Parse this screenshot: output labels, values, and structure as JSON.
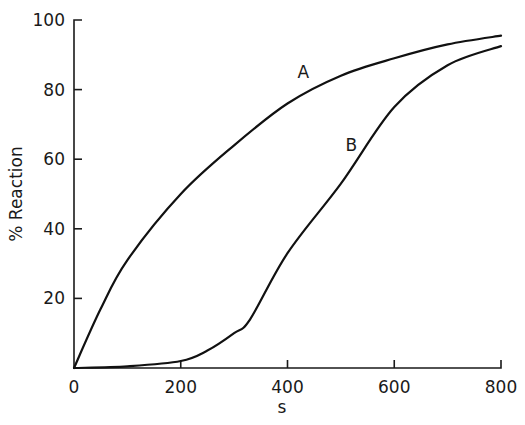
{
  "chart_data": {
    "type": "line",
    "title": "",
    "xlabel": "s",
    "ylabel": "% Reaction",
    "xlim": [
      0,
      800
    ],
    "ylim": [
      0,
      100
    ],
    "grid": false,
    "legend": "none (curves labelled inline)",
    "x_ticks": [
      0,
      200,
      400,
      600,
      800
    ],
    "y_ticks": [
      20,
      40,
      60,
      80,
      100
    ],
    "x_tick_labels": [
      "0",
      "200",
      "400",
      "600",
      "800"
    ],
    "y_tick_labels": [
      "20",
      "40",
      "60",
      "80",
      "100"
    ],
    "series": [
      {
        "name": "A",
        "x": [
          0,
          50,
          100,
          200,
          300,
          400,
          500,
          600,
          700,
          800
        ],
        "values": [
          0,
          17,
          31,
          50,
          64,
          76,
          84,
          89,
          93,
          95.5
        ]
      },
      {
        "name": "B",
        "x": [
          0,
          100,
          200,
          250,
          300,
          330,
          400,
          500,
          600,
          700,
          800
        ],
        "values": [
          0,
          0.5,
          2,
          5,
          10,
          14,
          33,
          53,
          75,
          87,
          92.5
        ]
      }
    ],
    "annotations": [
      {
        "text": "A",
        "x": 430,
        "y": 84
      },
      {
        "text": "B",
        "x": 520,
        "y": 63
      }
    ]
  }
}
